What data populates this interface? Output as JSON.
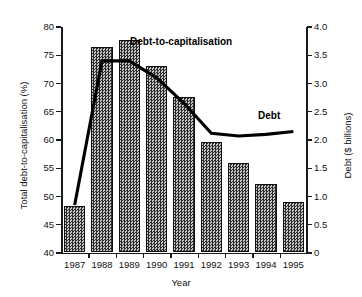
{
  "chart_data": {
    "type": "bar",
    "title": "",
    "xlabel": "Year",
    "ylabel": "Total debt-to-capitalisation (%)",
    "ylabel_right": "Debt ($ billions)",
    "grid": false,
    "legend_position": "inline-annotations",
    "categories": [
      "1987",
      "1988",
      "1989",
      "1990",
      "1991",
      "1992",
      "1993",
      "1994",
      "1995"
    ],
    "ylim": [
      40,
      80
    ],
    "ylim_right": [
      0,
      4.0
    ],
    "yticks": [
      "40",
      "45",
      "50",
      "55",
      "60",
      "65",
      "70",
      "75",
      "80"
    ],
    "ytick_values": [
      40,
      45,
      50,
      55,
      60,
      65,
      70,
      75,
      80
    ],
    "yticks_right": [
      "0",
      "0.5",
      "1.0",
      "1.5",
      "2.0",
      "2.5",
      "3.0",
      "3.5",
      "4.0"
    ],
    "ytick_values_right": [
      0,
      0.5,
      1.0,
      1.5,
      2.0,
      2.5,
      3.0,
      3.5,
      4.0
    ],
    "series": [
      {
        "name": "Debt-to-capitalisation",
        "render": "bar",
        "axis": "left",
        "unit": "%",
        "values": [
          48.0,
          76.2,
          77.4,
          72.8,
          67.4,
          59.4,
          55.6,
          52.0,
          48.8
        ]
      },
      {
        "name": "Debt",
        "render": "line",
        "axis": "right",
        "unit": "$ billions",
        "values": [
          0.85,
          3.4,
          3.4,
          3.1,
          2.65,
          2.12,
          2.07,
          2.1,
          2.15
        ]
      }
    ],
    "annotations": [
      {
        "text": "Debt-to-capitalisation",
        "target": "bar-series"
      },
      {
        "text": "Debt",
        "target": "line-series"
      }
    ],
    "colors": {
      "bar_fill": "#6e6e6e",
      "bar_edge": "#111111",
      "line": "#000000",
      "axis": "#1a1a1a",
      "background": "#ffffff"
    }
  }
}
